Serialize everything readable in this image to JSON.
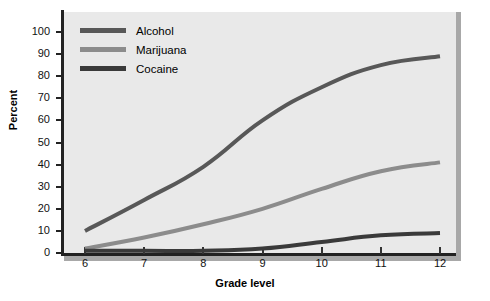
{
  "chart_data": {
    "type": "line",
    "title": "",
    "xlabel": "Grade level",
    "ylabel": "Percent",
    "x": [
      6,
      7,
      8,
      9,
      10,
      11,
      12
    ],
    "categories": [
      "6",
      "7",
      "8",
      "9",
      "10",
      "11",
      "12"
    ],
    "xlim": [
      6,
      12
    ],
    "ylim": [
      0,
      100
    ],
    "ytick_labels": [
      "0",
      "10",
      "20",
      "30",
      "40",
      "50",
      "60",
      "70",
      "80",
      "90",
      "100"
    ],
    "ytick_values": [
      0,
      10,
      20,
      30,
      40,
      50,
      60,
      70,
      80,
      90,
      100
    ],
    "xtick_labels": [
      "6",
      "7",
      "8",
      "9",
      "10",
      "11",
      "12"
    ],
    "grid": false,
    "legend_position": "top-left",
    "series": [
      {
        "name": "Alcohol",
        "color": "#585858",
        "values": [
          10,
          24,
          39,
          60,
          75,
          85,
          89
        ]
      },
      {
        "name": "Marijuana",
        "color": "#8c8c8c",
        "values": [
          2,
          7,
          13,
          20,
          29,
          37,
          41
        ]
      },
      {
        "name": "Cocaine",
        "color": "#3a3a3a",
        "values": [
          1,
          1,
          1,
          2,
          5,
          8,
          9
        ]
      }
    ]
  },
  "axes": {
    "y_title": "Percent",
    "x_title": "Grade level"
  },
  "legend": {
    "items": [
      {
        "label": "Alcohol",
        "color": "#585858"
      },
      {
        "label": "Marijuana",
        "color": "#8c8c8c"
      },
      {
        "label": "Cocaine",
        "color": "#3a3a3a"
      }
    ]
  },
  "colors": {
    "plot_background": "#e9e9e9",
    "page_background": "#ffffff",
    "axis": "#222222",
    "frame_shadow": "#a8a8a8",
    "text": "#000000"
  }
}
